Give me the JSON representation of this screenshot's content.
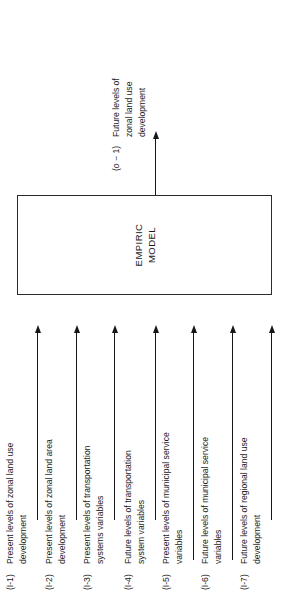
{
  "figure": {
    "type": "block-flow-diagram",
    "orientation": "rotated-90-ccw",
    "model_box": {
      "title_line1": "EMPIRIC",
      "title_line2": "MODEL"
    },
    "inputs": [
      {
        "tag": "(I-1)",
        "line1": "Present levels of zonal land use",
        "line2": "development",
        "arrow": "up-arrow"
      },
      {
        "tag": "(I-2)",
        "line1": "Present levels of zonal land area",
        "line2": "development",
        "arrow": "up-arrow"
      },
      {
        "tag": "(I-3)",
        "line1": "Present levels of transportation",
        "line2": "systems variables",
        "arrow": "up-arrow"
      },
      {
        "tag": "(I-4)",
        "line1": "Future levels of transportation",
        "line2": "system variables",
        "arrow": "up-arrow"
      },
      {
        "tag": "(I-5)",
        "line1": "Present levels of municipal service",
        "line2": "variables",
        "arrow": "up-arrow"
      },
      {
        "tag": "(I-6)",
        "line1": "Future levels of municipal service",
        "line2": "variables",
        "arrow": "up-arrow"
      },
      {
        "tag": "(I-7)",
        "line1": "Future levels of regional land use",
        "line2": "development",
        "arrow": "up-arrow"
      }
    ],
    "output": {
      "tag_prefix": "(",
      "tag_italic": "o",
      "tag_suffix": " − 1)",
      "tag_full": "(o − 1)",
      "line1": "Future levels of",
      "line2": "zonal land use",
      "line3": "development",
      "arrow": "up-arrow"
    },
    "colors": {
      "background": "#ffffff",
      "ink": "#1a1a1a",
      "stroke": "#2b2b2b"
    }
  }
}
